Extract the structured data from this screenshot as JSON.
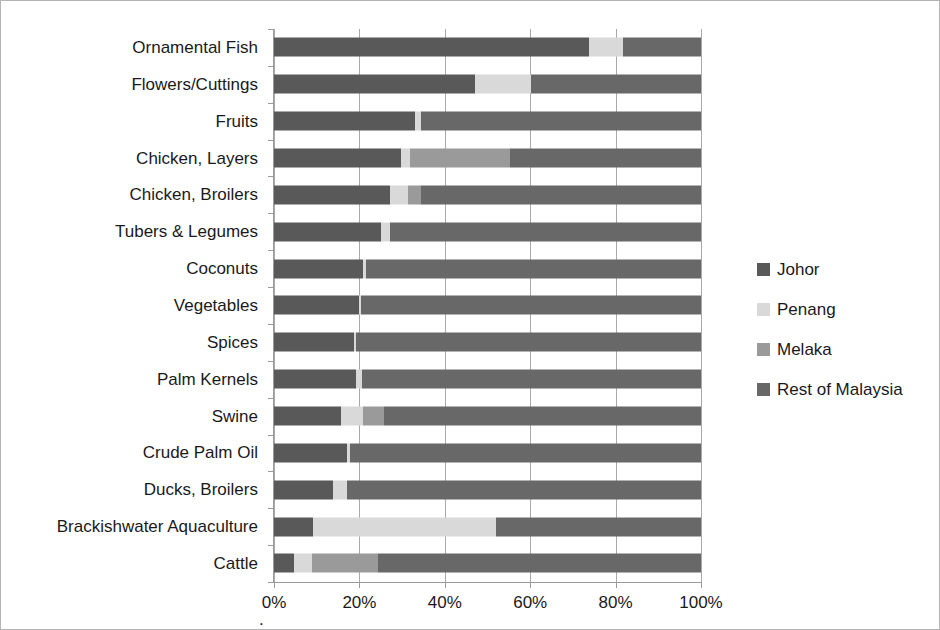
{
  "chart_data": {
    "type": "bar",
    "subtype": "horizontal-stacked-100-percent",
    "title": "",
    "xlabel": "",
    "ylabel": "",
    "xlim": [
      0,
      100
    ],
    "xticks": [
      "0%",
      "20%",
      "40%",
      "60%",
      "80%",
      "100%"
    ],
    "xtick_values": [
      0,
      20,
      40,
      60,
      80,
      100
    ],
    "grid": "vertical",
    "legend_position": "right",
    "origin_marker": ".",
    "categories": [
      "Ornamental Fish",
      "Flowers/Cuttings",
      "Fruits",
      "Chicken, Layers",
      "Chicken, Broilers",
      "Tubers & Legumes",
      "Coconuts",
      "Vegetables",
      "Spices",
      "Palm Kernels",
      "Swine",
      "Crude Palm Oil",
      "Ducks, Broilers",
      "Brackishwater Aquaculture",
      "Cattle"
    ],
    "series": [
      {
        "name": "Johor",
        "color": "#595959",
        "values": [
          73.8,
          47.0,
          33.0,
          29.8,
          27.2,
          25.0,
          20.8,
          19.9,
          18.7,
          19.3,
          15.7,
          17.0,
          13.8,
          9.1,
          4.7
        ]
      },
      {
        "name": "Penang",
        "color": "#d9d9d9",
        "values": [
          7.9,
          13.1,
          1.4,
          2.1,
          4.2,
          2.1,
          0.7,
          0.5,
          0.4,
          1.2,
          5.2,
          0.7,
          3.3,
          42.9,
          4.2
        ]
      },
      {
        "name": "Melaka",
        "color": "#9a9a9a",
        "values": [
          0.0,
          0.0,
          0.0,
          23.4,
          3.0,
          0.0,
          0.0,
          0.0,
          0.0,
          0.0,
          4.9,
          0.0,
          0.0,
          0.0,
          15.5
        ]
      },
      {
        "name": "Rest of Malaysia",
        "color": "#686868",
        "values": [
          18.3,
          39.9,
          65.6,
          44.7,
          65.6,
          72.9,
          78.5,
          79.6,
          80.9,
          79.5,
          74.2,
          82.3,
          82.9,
          48.0,
          75.6
        ]
      }
    ]
  },
  "legend": {
    "items": [
      {
        "label": "Johor",
        "color": "#595959",
        "swatch_name": "legend-swatch-johor"
      },
      {
        "label": "Penang",
        "color": "#d9d9d9",
        "swatch_name": "legend-swatch-penang"
      },
      {
        "label": "Melaka",
        "color": "#9a9a9a",
        "swatch_name": "legend-swatch-melaka"
      },
      {
        "label": "Rest of Malaysia",
        "color": "#686868",
        "swatch_name": "legend-swatch-rest-of-malaysia"
      }
    ]
  }
}
